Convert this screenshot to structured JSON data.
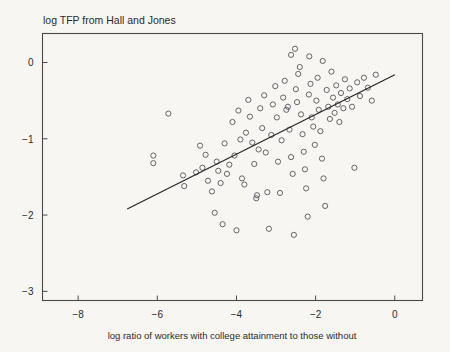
{
  "chart_data": {
    "type": "scatter",
    "title": "log TFP from Hall and Jones",
    "xlabel": "log ratio of workers with college attainment to those without",
    "ylabel": "",
    "xlim": [
      -8.9,
      0.7
    ],
    "ylim": [
      -3.12,
      0.38
    ],
    "xticks": [
      -8,
      -6,
      -4,
      -2,
      0
    ],
    "xtick_labels": [
      "−8",
      "−6",
      "−4",
      "−2",
      "0"
    ],
    "yticks": [
      0,
      -1,
      -2,
      -3
    ],
    "ytick_labels": [
      "0",
      "−1",
      "−2",
      "−3"
    ],
    "grid": false,
    "legend": null,
    "marker": "open-circle",
    "marker_color": "#55555a",
    "background_color": "#f7f6f2",
    "axis_color": "#4a4a4a",
    "fit_line": {
      "label": "regression line",
      "color": "#262626",
      "x_start": -6.76,
      "y_start": -1.92,
      "x_end": 0.0,
      "y_end": -0.16,
      "slope": 0.26,
      "intercept": -0.16
    },
    "n_points": 103,
    "points": [
      [
        -6.1,
        -1.22
      ],
      [
        -6.1,
        -1.32
      ],
      [
        -5.72,
        -0.67
      ],
      [
        -5.35,
        -1.48
      ],
      [
        -5.32,
        -1.62
      ],
      [
        -5.02,
        -1.44
      ],
      [
        -4.92,
        -1.09
      ],
      [
        -4.86,
        -1.38
      ],
      [
        -4.78,
        -1.21
      ],
      [
        -4.72,
        -1.55
      ],
      [
        -4.62,
        -1.69
      ],
      [
        -4.55,
        -1.97
      ],
      [
        -4.5,
        -1.3
      ],
      [
        -4.46,
        -1.42
      ],
      [
        -4.4,
        -1.58
      ],
      [
        -4.35,
        -2.12
      ],
      [
        -4.3,
        -1.06
      ],
      [
        -4.24,
        -1.46
      ],
      [
        -4.18,
        -1.34
      ],
      [
        -4.1,
        -0.78
      ],
      [
        -4.05,
        -1.22
      ],
      [
        -4.0,
        -2.2
      ],
      [
        -3.95,
        -0.63
      ],
      [
        -3.9,
        -1.01
      ],
      [
        -3.86,
        -1.52
      ],
      [
        -3.8,
        -1.6
      ],
      [
        -3.76,
        -0.92
      ],
      [
        -3.7,
        -0.49
      ],
      [
        -3.66,
        -0.71
      ],
      [
        -3.6,
        -1.05
      ],
      [
        -3.55,
        -1.33
      ],
      [
        -3.5,
        -1.78
      ],
      [
        -3.48,
        -1.74
      ],
      [
        -3.44,
        -1.14
      ],
      [
        -3.4,
        -0.6
      ],
      [
        -3.35,
        -0.86
      ],
      [
        -3.3,
        -0.43
      ],
      [
        -3.26,
        -1.18
      ],
      [
        -3.22,
        -1.7
      ],
      [
        -3.18,
        -2.18
      ],
      [
        -3.12,
        -0.95
      ],
      [
        -3.08,
        -0.55
      ],
      [
        -3.02,
        -0.31
      ],
      [
        -2.98,
        -0.72
      ],
      [
        -2.95,
        -1.3
      ],
      [
        -2.9,
        -1.71
      ],
      [
        -2.86,
        -1.02
      ],
      [
        -2.82,
        -0.46
      ],
      [
        -2.78,
        -0.24
      ],
      [
        -2.74,
        -0.62
      ],
      [
        -2.7,
        -0.58
      ],
      [
        -2.66,
        -0.88
      ],
      [
        -2.62,
        -1.24
      ],
      [
        -2.58,
        -1.46
      ],
      [
        -2.55,
        -2.26
      ],
      [
        -2.5,
        -0.35
      ],
      [
        -2.47,
        -0.52
      ],
      [
        -2.44,
        -0.15
      ],
      [
        -2.4,
        -0.06
      ],
      [
        -2.37,
        -0.68
      ],
      [
        -2.33,
        -0.94
      ],
      [
        -2.3,
        -1.17
      ],
      [
        -2.27,
        -1.4
      ],
      [
        -2.24,
        -1.65
      ],
      [
        -2.2,
        -2.02
      ],
      [
        -2.17,
        -0.42
      ],
      [
        -2.13,
        -0.28
      ],
      [
        -2.1,
        -0.72
      ],
      [
        -2.06,
        -0.84
      ],
      [
        -2.02,
        -1.08
      ],
      [
        -1.98,
        -0.5
      ],
      [
        -1.95,
        -0.2
      ],
      [
        -1.92,
        -0.62
      ],
      [
        -1.88,
        -0.9
      ],
      [
        -1.84,
        -1.26
      ],
      [
        -1.8,
        -1.52
      ],
      [
        -1.76,
        -1.88
      ],
      [
        -1.72,
        -0.36
      ],
      [
        -1.68,
        -0.58
      ],
      [
        -1.64,
        -0.74
      ],
      [
        -1.6,
        -0.12
      ],
      [
        -1.56,
        -0.46
      ],
      [
        -1.52,
        -0.66
      ],
      [
        -1.48,
        -0.3
      ],
      [
        -1.44,
        -0.55
      ],
      [
        -1.4,
        -0.78
      ],
      [
        -1.36,
        -0.4
      ],
      [
        -1.3,
        -0.6
      ],
      [
        -1.26,
        -0.22
      ],
      [
        -1.2,
        -0.48
      ],
      [
        -1.14,
        -0.34
      ],
      [
        -1.08,
        -0.58
      ],
      [
        -1.02,
        -1.38
      ],
      [
        -0.95,
        -0.26
      ],
      [
        -0.88,
        -0.44
      ],
      [
        -0.78,
        -0.2
      ],
      [
        -0.68,
        -0.33
      ],
      [
        -0.58,
        -0.5
      ],
      [
        -0.48,
        -0.16
      ],
      [
        -2.52,
        0.18
      ],
      [
        -2.62,
        0.1
      ],
      [
        -2.16,
        0.08
      ],
      [
        -1.82,
        0.02
      ]
    ]
  }
}
